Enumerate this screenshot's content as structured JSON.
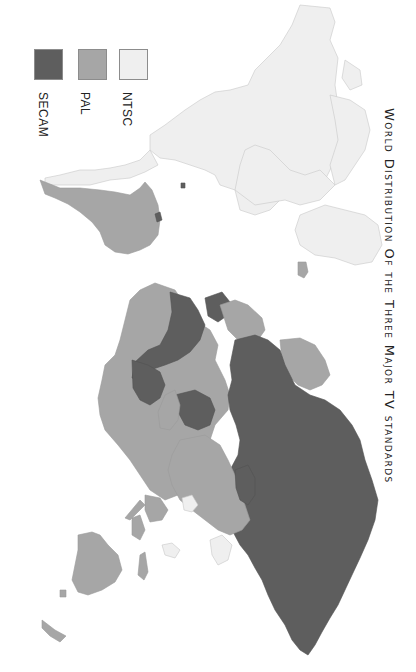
{
  "title": "World Distribution Of the Three Major TV standards",
  "legend": {
    "items": [
      {
        "label": "SECAM",
        "color": "#5e5e5e"
      },
      {
        "label": "PAL",
        "color": "#a6a6a6"
      },
      {
        "label": "NTSC",
        "color": "#efefef"
      }
    ]
  },
  "map": {
    "orientation": "rotated 90 degrees clockwise",
    "regions": [
      {
        "name": "North America",
        "standard": "NTSC"
      },
      {
        "name": "Greenland",
        "standard": "NTSC"
      },
      {
        "name": "Central America",
        "standard": "NTSC"
      },
      {
        "name": "South America (Brazil, Argentina etc.)",
        "standard": "PAL"
      },
      {
        "name": "French Guiana",
        "standard": "SECAM"
      },
      {
        "name": "Western Europe",
        "standard": "PAL"
      },
      {
        "name": "France",
        "standard": "SECAM"
      },
      {
        "name": "Eastern Europe / Russia",
        "standard": "SECAM"
      },
      {
        "name": "Northern & Western Africa",
        "standard": "SECAM"
      },
      {
        "name": "Southern Africa",
        "standard": "PAL"
      },
      {
        "name": "Middle East",
        "standard": "SECAM"
      },
      {
        "name": "China",
        "standard": "PAL"
      },
      {
        "name": "India",
        "standard": "PAL"
      },
      {
        "name": "Japan / Korea / Philippines",
        "standard": "NTSC"
      },
      {
        "name": "Australia",
        "standard": "PAL"
      },
      {
        "name": "Indonesia",
        "standard": "PAL"
      },
      {
        "name": "Iceland",
        "standard": "PAL"
      }
    ]
  }
}
